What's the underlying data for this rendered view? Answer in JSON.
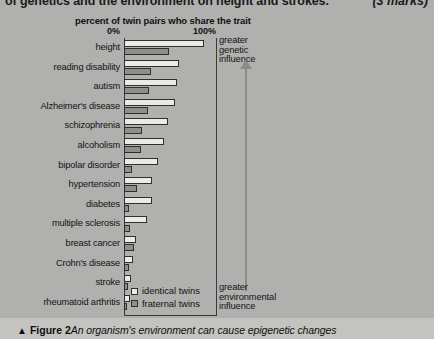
{
  "question": {
    "text": "of genetics and the environment on height and strokes.",
    "marks": "(3 marks)"
  },
  "chart": {
    "axis_title": "percent of twin pairs who share the trait",
    "tick_low": "0%",
    "tick_high": "100%",
    "annotation_top": "greater\ngenetic\ninfluence",
    "annotation_top_lines": [
      "greater",
      "genetic",
      "influence"
    ],
    "annotation_bottom_lines": [
      "greater",
      "environmental",
      "influence"
    ],
    "legend": [
      {
        "label": "identical twins",
        "color": "#eceae4",
        "key": "identical"
      },
      {
        "label": "fraternal twins",
        "color": "#8e8e8b",
        "key": "fraternal"
      }
    ]
  },
  "caption": {
    "triangle": "▲",
    "figure_number": "Figure 2",
    "text": "An organism's environment can cause epigenetic changes"
  },
  "chart_data": {
    "type": "bar",
    "orientation": "horizontal",
    "title": "percent of twin pairs who share the trait",
    "xlabel": "percent of twin pairs who share the trait",
    "ylabel": "",
    "xlim": [
      0,
      100
    ],
    "xticks": [
      0,
      100
    ],
    "xticklabels": [
      "0%",
      "100%"
    ],
    "grid": false,
    "legend_position": "bottom-inside",
    "categories": [
      "height",
      "reading disability",
      "autism",
      "Alzheimer's disease",
      "schizophrenia",
      "alcoholism",
      "bipolar disorder",
      "hypertension",
      "diabetes",
      "multiple sclerosis",
      "breast cancer",
      "Crohn's disease",
      "stroke",
      "rheumatoid arthritis"
    ],
    "series": [
      {
        "name": "identical twins",
        "color": "#eceae4",
        "values": [
          87,
          60,
          58,
          55,
          48,
          43,
          37,
          30,
          30,
          25,
          13,
          10,
          8,
          7
        ]
      },
      {
        "name": "fraternal twins",
        "color": "#8e8e8b",
        "values": [
          49,
          29,
          27,
          26,
          20,
          18,
          9,
          14,
          5,
          6,
          11,
          5,
          4,
          3
        ]
      }
    ]
  }
}
